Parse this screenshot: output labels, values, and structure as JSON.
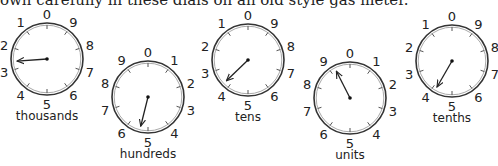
{
  "caption": "own carefully in these dials on an old style gas meter.",
  "dials": [
    {
      "label": "thousands",
      "cx": 47,
      "cy": 59,
      "direction": "counterclockwise",
      "hand_angle": 266
    },
    {
      "label": "hundreds",
      "cx": 148,
      "cy": 97,
      "direction": "clockwise",
      "hand_angle": 194
    },
    {
      "label": "tens",
      "cx": 248,
      "cy": 60,
      "direction": "counterclockwise",
      "hand_angle": 226
    },
    {
      "label": "units",
      "cx": 350,
      "cy": 98,
      "direction": "clockwise",
      "hand_angle": 333
    },
    {
      "label": "tenths",
      "cx": 452,
      "cy": 61,
      "direction": "counterclockwise",
      "hand_angle": 210
    }
  ],
  "dial_numbers": [
    "0",
    "1",
    "2",
    "3",
    "4",
    "5",
    "6",
    "7",
    "8",
    "9"
  ],
  "style": {
    "ring_color": "#333333",
    "hand_color": "#222222",
    "radius": 36
  }
}
